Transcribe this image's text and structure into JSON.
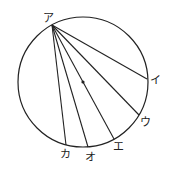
{
  "diagram": {
    "circle": {
      "cx": 83,
      "cy": 82,
      "r": 65,
      "stroke": "#222222"
    },
    "center_dot": {
      "cx": 83,
      "cy": 82
    },
    "apex": {
      "label": "ア",
      "x": 52,
      "y": 25
    },
    "points": [
      {
        "label": "イ",
        "x": 147,
        "y": 79
      },
      {
        "label": "ウ",
        "x": 139,
        "y": 115
      },
      {
        "label": "エ",
        "x": 114,
        "y": 139
      },
      {
        "label": "オ",
        "x": 88,
        "y": 147
      },
      {
        "label": "カ",
        "x": 66,
        "y": 145
      }
    ],
    "labels": {
      "a": "ア",
      "i": "イ",
      "u": "ウ",
      "e": "エ",
      "o": "オ",
      "ka": "カ"
    }
  }
}
